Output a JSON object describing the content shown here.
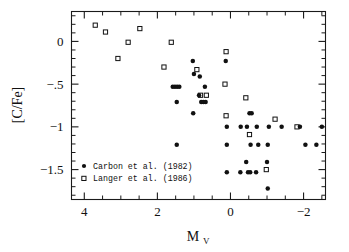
{
  "figure": {
    "background_color": "#ffffff",
    "ink_color": "#111111"
  },
  "axes": {
    "x": {
      "label_main": "M",
      "label_sub": "V",
      "ticks": [
        {
          "value": 4,
          "label": "4"
        },
        {
          "value": 2,
          "label": "2"
        },
        {
          "value": 0,
          "label": "0"
        },
        {
          "value": -2,
          "label": "−2"
        }
      ],
      "minor_step": 0.5,
      "range": [
        4.35,
        -2.6
      ],
      "reversed": true
    },
    "y": {
      "label": "[C/Fe]",
      "ticks": [
        {
          "value": 0,
          "label": "0"
        },
        {
          "value": -0.5,
          "label": "−.5"
        },
        {
          "value": -1,
          "label": "−1"
        },
        {
          "value": -1.5,
          "label": "−1.5"
        }
      ],
      "minor_step": 0.1,
      "range": [
        0.35,
        -1.85
      ]
    }
  },
  "legend": {
    "entries": [
      {
        "marker": "filled-circle",
        "label": "Carbon et al. (1982)"
      },
      {
        "marker": "open-square",
        "label": "Langer et al. (1986)"
      }
    ]
  },
  "chart_data": {
    "type": "scatter",
    "title": "",
    "xlabel": "M_V",
    "ylabel": "[C/Fe]",
    "xlim": [
      4.35,
      -2.6
    ],
    "ylim": [
      -1.85,
      0.35
    ],
    "x_axis_reversed": true,
    "grid": false,
    "legend_position": "lower-left",
    "series": [
      {
        "name": "Carbon et al. (1982)",
        "marker": "filled-circle",
        "color": "#111111",
        "points": [
          [
            1.58,
            -0.53
          ],
          [
            1.52,
            -0.53
          ],
          [
            1.46,
            -0.53
          ],
          [
            1.4,
            -0.53
          ],
          [
            1.47,
            -0.71
          ],
          [
            1.47,
            -1.21
          ],
          [
            1.02,
            -0.84
          ],
          [
            1.03,
            -0.23
          ],
          [
            1.0,
            -0.38
          ],
          [
            0.84,
            -0.41
          ],
          [
            0.86,
            -0.63
          ],
          [
            0.8,
            -0.71
          ],
          [
            0.74,
            -0.71
          ],
          [
            0.68,
            -0.71
          ],
          [
            0.7,
            -0.53
          ],
          [
            0.13,
            -0.23
          ],
          [
            0.1,
            -1.0
          ],
          [
            0.1,
            -1.21
          ],
          [
            0.1,
            -1.53
          ],
          [
            -0.28,
            -1.0
          ],
          [
            -0.27,
            -1.53
          ],
          [
            -0.45,
            -1.0
          ],
          [
            -0.43,
            -1.41
          ],
          [
            -0.48,
            -1.53
          ],
          [
            -0.54,
            -1.53
          ],
          [
            -0.52,
            -0.84
          ],
          [
            -0.58,
            -0.84
          ],
          [
            -0.55,
            -1.21
          ],
          [
            -0.72,
            -1.0
          ],
          [
            -0.76,
            -1.21
          ],
          [
            -0.7,
            -1.53
          ],
          [
            -1.05,
            -1.0
          ],
          [
            -1.02,
            -1.21
          ],
          [
            -1.0,
            -1.41
          ],
          [
            -1.02,
            -1.72
          ],
          [
            -1.4,
            -1.0
          ],
          [
            -1.9,
            -1.0
          ],
          [
            -2.05,
            -1.21
          ],
          [
            -2.35,
            -1.21
          ],
          [
            -2.5,
            -1.0
          ]
        ]
      },
      {
        "name": "Langer et al. (1986)",
        "marker": "open-square",
        "color": "#111111",
        "points": [
          [
            3.7,
            0.19
          ],
          [
            3.42,
            0.11
          ],
          [
            3.08,
            -0.2
          ],
          [
            2.8,
            -0.01
          ],
          [
            2.48,
            0.15
          ],
          [
            1.82,
            -0.3
          ],
          [
            1.62,
            -0.01
          ],
          [
            0.92,
            -0.33
          ],
          [
            0.82,
            -0.63
          ],
          [
            0.66,
            -0.63
          ],
          [
            0.12,
            -0.12
          ],
          [
            0.15,
            -0.5
          ],
          [
            0.12,
            -0.87
          ],
          [
            -0.42,
            -0.66
          ],
          [
            -0.52,
            -1.09
          ],
          [
            -0.98,
            -1.5
          ],
          [
            -1.22,
            -0.91
          ],
          [
            -1.82,
            -1.0
          ]
        ]
      }
    ]
  }
}
